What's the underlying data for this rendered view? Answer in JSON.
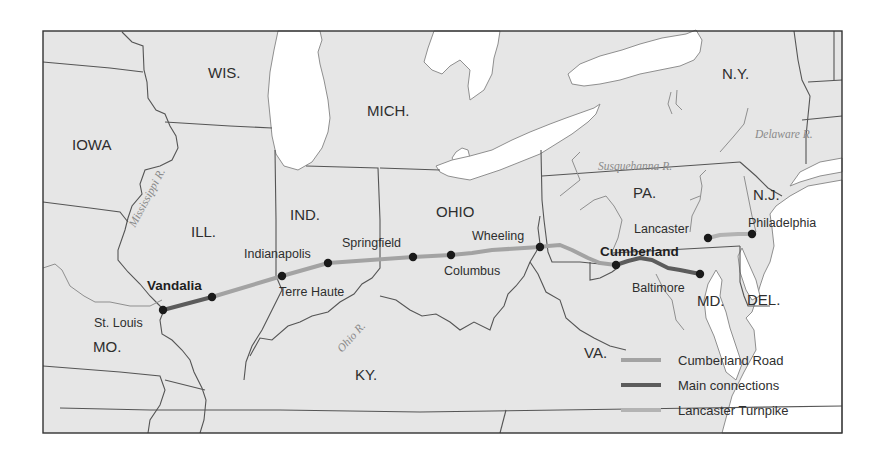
{
  "map": {
    "frame": {
      "x": 43,
      "y": 31,
      "width": 799,
      "height": 402
    },
    "colors": {
      "land": "#e6e6e6",
      "water": "#ffffff",
      "cumberland_road": "#a3a3a3",
      "main_connections": "#5c5c5c",
      "lancaster_turnpike": "#b3b3b3",
      "city_dot": "#1a1a1a"
    },
    "states": [
      {
        "label": "WIS.",
        "x": 208,
        "y": 78
      },
      {
        "label": "IOWA",
        "x": 72,
        "y": 150
      },
      {
        "label": "MICH.",
        "x": 367,
        "y": 116
      },
      {
        "label": "N.Y.",
        "x": 722,
        "y": 79
      },
      {
        "label": "ILL.",
        "x": 191,
        "y": 237
      },
      {
        "label": "IND.",
        "x": 290,
        "y": 220
      },
      {
        "label": "OHIO",
        "x": 436,
        "y": 217
      },
      {
        "label": "PA.",
        "x": 633,
        "y": 198
      },
      {
        "label": "N.J.",
        "x": 753,
        "y": 200
      },
      {
        "label": "MO.",
        "x": 93,
        "y": 352
      },
      {
        "label": "KY.",
        "x": 355,
        "y": 380
      },
      {
        "label": "VA.",
        "x": 584,
        "y": 358
      },
      {
        "label": "MD.",
        "x": 697,
        "y": 306
      },
      {
        "label": "DEL.",
        "x": 747,
        "y": 305
      }
    ],
    "rivers": [
      {
        "label": "Mississippi R.",
        "x": 135,
        "y": 228,
        "rotate": -62
      },
      {
        "label": "Ohio R.",
        "x": 342,
        "y": 353,
        "rotate": -48
      },
      {
        "label": "Susquehanna R.",
        "x": 598,
        "y": 170,
        "rotate": 0
      },
      {
        "label": "Delaware R.",
        "x": 755,
        "y": 138,
        "rotate": 0
      }
    ],
    "cities": [
      {
        "name": "St. Louis",
        "x": 163,
        "y": 310,
        "label_x": 94,
        "label_y": 327,
        "bold": false
      },
      {
        "name": "Vandalia",
        "x": 212,
        "y": 297,
        "label_x": 147,
        "label_y": 290,
        "bold": true
      },
      {
        "name": "Terre Haute",
        "x": 282,
        "y": 276,
        "label_x": 279,
        "label_y": 296,
        "bold": false
      },
      {
        "name": "Indianapolis",
        "x": 328,
        "y": 263,
        "label_x": 244,
        "label_y": 258,
        "bold": false
      },
      {
        "name": "Springfield",
        "x": 413,
        "y": 257,
        "label_x": 342,
        "label_y": 247,
        "bold": false
      },
      {
        "name": "Columbus",
        "x": 451,
        "y": 255,
        "label_x": 444,
        "label_y": 275,
        "bold": false
      },
      {
        "name": "Wheeling",
        "x": 540,
        "y": 247,
        "label_x": 472,
        "label_y": 240,
        "bold": false
      },
      {
        "name": "Cumberland",
        "x": 616,
        "y": 265,
        "label_x": 600,
        "label_y": 256,
        "bold": true
      },
      {
        "name": "Baltimore",
        "x": 700,
        "y": 274,
        "label_x": 632,
        "label_y": 292,
        "bold": false
      },
      {
        "name": "Lancaster",
        "x": 708,
        "y": 238,
        "label_x": 634,
        "label_y": 233,
        "bold": false
      },
      {
        "name": "Philadelphia",
        "x": 752,
        "y": 234,
        "label_x": 748,
        "label_y": 227,
        "bold": false
      }
    ],
    "routes": {
      "main_connections": [
        {
          "from": "St. Louis",
          "to": "Vandalia",
          "points": "163,310 212,297"
        },
        {
          "from": "Cumberland",
          "to": "Baltimore",
          "points": "616,265 628,261 640,258 652,260 660,264 668,268 680,270 700,274"
        }
      ],
      "cumberland_road": {
        "from": "Vandalia",
        "to": "Wheeling",
        "points": "212,297 282,276 328,263 413,257 451,255 472,253 492,250 540,247 548,246 560,245 572,250 588,258 600,263 616,265"
      },
      "lancaster_turnpike": {
        "from": "Lancaster",
        "to": "Philadelphia",
        "points": "708,238 720,235 738,234 752,234"
      }
    },
    "legend": {
      "items": [
        {
          "label": "Cumberland Road",
          "color": "#a3a3a3",
          "y": 360
        },
        {
          "label": "Main connections",
          "color": "#5c5c5c",
          "y": 385
        },
        {
          "label": "Lancaster Turnpike",
          "color": "#b3b3b3",
          "y": 410
        }
      ]
    }
  }
}
